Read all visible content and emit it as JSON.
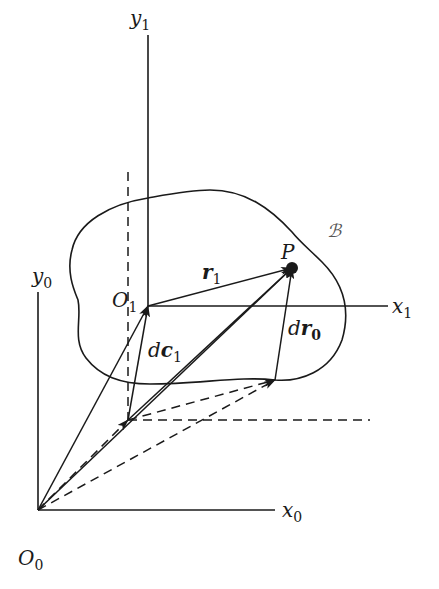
{
  "figure": {
    "type": "kinematics-diagram",
    "stroke_color": "#1a1a1a",
    "labels": {
      "y1": {
        "base": "y",
        "sub": "1"
      },
      "x1": {
        "base": "x",
        "sub": "1"
      },
      "y0": {
        "base": "y",
        "sub": "0"
      },
      "x0": {
        "base": "x",
        "sub": "0"
      },
      "O1": {
        "base": "O",
        "sub": "1"
      },
      "O0": {
        "base": "O",
        "sub": "0"
      },
      "P": {
        "base": "P"
      },
      "r1": {
        "base": "r",
        "sub": "1"
      },
      "dc1": {
        "prefix": "d",
        "base": "c",
        "sub": "1"
      },
      "dr0": {
        "prefix": "d",
        "base": "r",
        "sub": "0"
      },
      "body": {
        "base": "ℬ"
      }
    },
    "points": {
      "O0": [
        38,
        510
      ],
      "O1": [
        148,
        306
      ],
      "P": [
        292,
        268
      ],
      "A": [
        128,
        420
      ],
      "B": [
        275,
        380
      ]
    }
  }
}
